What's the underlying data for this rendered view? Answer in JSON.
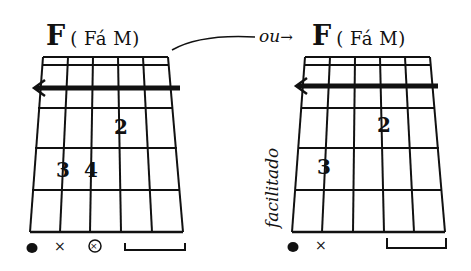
{
  "left_chord": {
    "name": "F",
    "label": "( Fá M)",
    "barre": "barre-arrow",
    "fingers": [
      {
        "number": "2",
        "string": 4,
        "fret": 2
      },
      {
        "number": "3",
        "string": 2,
        "fret": 3
      },
      {
        "number": "4",
        "string": 3,
        "fret": 3
      }
    ],
    "legend": [
      "filled-dot",
      "x-mark",
      "circled-x-mark",
      "bracket"
    ]
  },
  "connector": {
    "text": "ou",
    "arrow": "→"
  },
  "right_chord": {
    "name": "F",
    "label": "( Fá M)",
    "side_label": "facilitado",
    "barre": "barre-arrow",
    "fingers": [
      {
        "number": "2",
        "string": 4,
        "fret": 2
      },
      {
        "number": "3",
        "string": 2,
        "fret": 3
      }
    ],
    "legend": [
      "filled-dot",
      "x-mark",
      "bracket"
    ]
  },
  "legend_symbols": {
    "x": "×",
    "circled_x": "⊗"
  }
}
